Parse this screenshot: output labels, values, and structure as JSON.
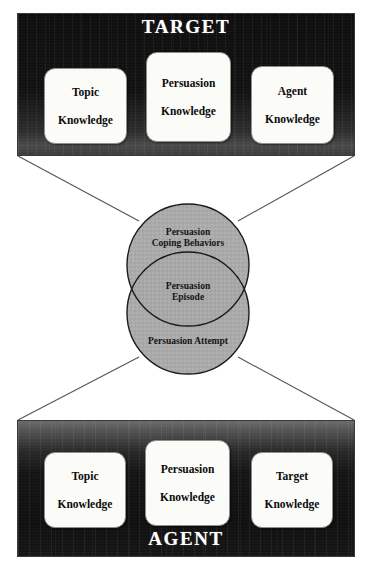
{
  "diagram": {
    "colors": {
      "panel_dark": "#101010",
      "panel_gradient_light": "#6a6a6a",
      "box_fill": "#fbfbf8",
      "box_border": "#8e8e8e",
      "circle_fill": "#a8a8a8",
      "circle_stroke": "#1a1a1a",
      "connector_line": "#555555",
      "title_text": "#ffffff",
      "body_text": "#0b0b0b",
      "background": "#ffffff"
    },
    "top_panel": {
      "title": "TARGET",
      "boxes": [
        {
          "id": "topic",
          "label": "Topic\nKnowledge",
          "line1": "Topic",
          "line2": "Knowledge"
        },
        {
          "id": "persuasion",
          "label": "Persuasion\nKnowledge",
          "line1": "Persuasion",
          "line2": "Knowledge"
        },
        {
          "id": "agent",
          "label": "Agent\nKnowledge",
          "line1": "Agent",
          "line2": "Knowledge"
        }
      ]
    },
    "bottom_panel": {
      "title": "AGENT",
      "boxes": [
        {
          "id": "topic",
          "label": "Topic\nKnowledge",
          "line1": "Topic",
          "line2": "Knowledge"
        },
        {
          "id": "persuasion",
          "label": "Persuasion\nKnowledge",
          "line1": "Persuasion",
          "line2": "Knowledge"
        },
        {
          "id": "target",
          "label": "Target\nKnowledge",
          "line1": "Target",
          "line2": "Knowledge"
        }
      ]
    },
    "venn": {
      "orientation": "vertical",
      "top_circle": {
        "label": "Persuasion Coping Behaviors",
        "line1": "Persuasion",
        "line2": "Coping Behaviors"
      },
      "intersection": {
        "label": "Persuasion Episode",
        "line1": "Persuasion",
        "line2": "Episode"
      },
      "bottom_circle": {
        "label": "Persuasion Attempt",
        "line1": "Persuasion Attempt",
        "line2": ""
      }
    },
    "connectors": {
      "description": "Four straight lines fan from the bottom corners of the TARGET panel to the upper sides of the top circle, and from the lower sides of the bottom circle to the top corners of the AGENT panel.",
      "count": 4
    }
  }
}
